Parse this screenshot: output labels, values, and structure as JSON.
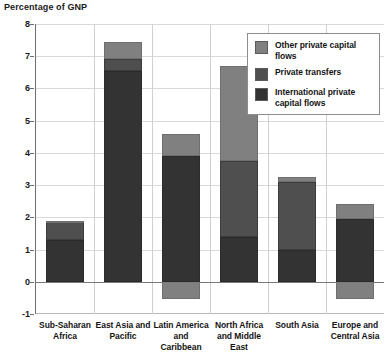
{
  "chart_data": {
    "type": "bar",
    "stacked": true,
    "title": "Percentage of GNP",
    "xlabel": "",
    "ylabel": "Percentage of GNP",
    "ylim": [
      -1,
      8
    ],
    "yticks": [
      -1,
      0,
      1,
      2,
      3,
      4,
      5,
      6,
      7,
      8
    ],
    "grid": true,
    "legend_position": "top-right",
    "categories": [
      "Sub-Saharan Africa",
      "East Asia and Pacific",
      "Latin America and Caribbean",
      "North Africa and Middle East",
      "South Asia",
      "Europe and Central Asia"
    ],
    "series": [
      {
        "name": "International private capital flows",
        "color": "#333333",
        "values": [
          1.3,
          6.55,
          3.9,
          1.4,
          1.0,
          1.95
        ]
      },
      {
        "name": "Private transfers",
        "color": "#4f4f4f",
        "values": [
          0.55,
          0.35,
          0.0,
          2.35,
          2.1,
          0.0
        ]
      },
      {
        "name": "Other private capital flows",
        "color": "#808080",
        "values": [
          0.05,
          0.55,
          0.7,
          2.95,
          0.15,
          0.45
        ]
      },
      {
        "name": "Other private capital flows (negative)",
        "color": "#808080",
        "values": [
          0.0,
          0.0,
          -0.55,
          0.0,
          0.0,
          -0.55
        ]
      }
    ],
    "totals": [
      1.9,
      7.45,
      4.6,
      6.7,
      3.25,
      2.4
    ]
  },
  "legend": {
    "items": [
      {
        "label": "Other private capital flows",
        "color": "#808080"
      },
      {
        "label": "Private transfers",
        "color": "#4f4f4f"
      },
      {
        "label": "International private capital flows",
        "color": "#333333"
      }
    ]
  },
  "colors": {
    "grid": "#d9d9d9",
    "axis": "#6e6e6e",
    "zero_line": "#7a7a7a",
    "text": "#141414",
    "background": "#ffffff"
  }
}
